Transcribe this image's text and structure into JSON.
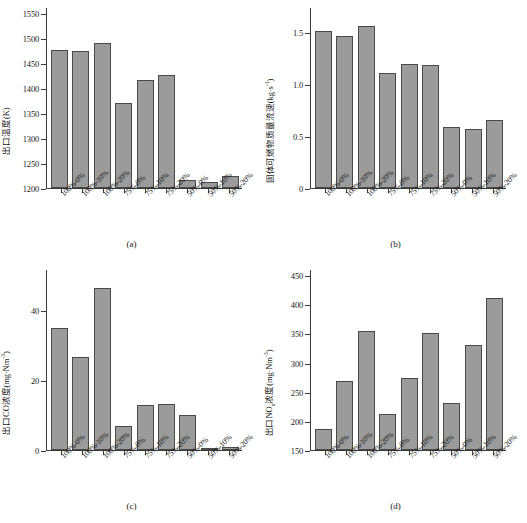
{
  "figure": {
    "categories": [
      "100%-0%",
      "100%-10%",
      "100%-20%",
      "75%-0%",
      "75%-10%",
      "75%-20%",
      "50%-0%",
      "50%-10%",
      "50%-20%"
    ]
  },
  "chart_data": [
    {
      "type": "bar",
      "panel": "(a)",
      "title": "",
      "xlabel": "",
      "ylabel": "出口温度(K)",
      "categories": [
        "100%-0%",
        "100%-10%",
        "100%-20%",
        "75%-0%",
        "75%-10%",
        "75%-20%",
        "50%-0%",
        "50%-10%",
        "50%-20%"
      ],
      "values": [
        1477,
        1474,
        1490,
        1371,
        1417,
        1427,
        1216,
        1212,
        1224
      ],
      "ylim": [
        1200,
        1550
      ],
      "yticks": [
        1200,
        1250,
        1300,
        1350,
        1400,
        1450,
        1500,
        1550
      ],
      "yticklabels": [
        "1200",
        "1250",
        "1300",
        "1350",
        "1400",
        "1450",
        "1500",
        "1550"
      ],
      "grid": false,
      "legend": "none",
      "bar_color": "#9b9b9b",
      "edge_color": "#4a4a4a"
    },
    {
      "type": "bar",
      "panel": "(b)",
      "title": "",
      "xlabel": "",
      "ylabel": "固体可燃物质量流速(kg·s⁻¹)",
      "categories": [
        "100%-0%",
        "100%-10%",
        "100%-20%",
        "75%-0%",
        "75%-10%",
        "75%-20%",
        "50%-0%",
        "50%-10%",
        "50%-20%"
      ],
      "values": [
        1.51,
        1.46,
        1.56,
        1.1,
        1.19,
        1.18,
        0.59,
        0.57,
        0.65
      ],
      "ylim": [
        0,
        1.68
      ],
      "yticks": [
        0,
        0.5,
        1.0,
        1.5
      ],
      "yticklabels": [
        "0",
        "0.5",
        "1.0",
        "1.5"
      ],
      "grid": false,
      "legend": "none",
      "bar_color": "#9b9b9b",
      "edge_color": "#4a4a4a"
    },
    {
      "type": "bar",
      "panel": "(c)",
      "title": "",
      "xlabel": "",
      "ylabel": "出口CO浓度(mg·Nm⁻³)",
      "categories": [
        "100%-0%",
        "100%-10%",
        "100%-20%",
        "75%-0%",
        "75%-10%",
        "75%-20%",
        "50%-0%",
        "50%-10%",
        "50%-20%"
      ],
      "values": [
        35.0,
        26.5,
        46.2,
        7.0,
        13.0,
        13.2,
        10.0,
        0.5,
        1.0
      ],
      "ylim": [
        0,
        50
      ],
      "yticks": [
        0,
        20,
        40
      ],
      "yticklabels": [
        "0",
        "20",
        "40"
      ],
      "grid": false,
      "legend": "none",
      "bar_color": "#9b9b9b",
      "edge_color": "#4a4a4a"
    },
    {
      "type": "bar",
      "panel": "(d)",
      "title": "",
      "xlabel": "",
      "ylabel": "出口NOx浓度(mg·Nm⁻³)",
      "categories": [
        "100%-0%",
        "100%-10%",
        "100%-20%",
        "75%-0%",
        "75%-10%",
        "75%-20%",
        "50%-0%",
        "50%-10%",
        "50%-20%"
      ],
      "values": [
        186,
        269,
        354,
        212,
        274,
        351,
        230,
        330,
        410
      ],
      "ylim": [
        150,
        450
      ],
      "yticks": [
        150,
        200,
        250,
        300,
        350,
        400,
        450
      ],
      "yticklabels": [
        "150",
        "200",
        "250",
        "300",
        "350",
        "400",
        "450"
      ],
      "grid": false,
      "legend": "none",
      "bar_color": "#9b9b9b",
      "edge_color": "#4a4a4a"
    }
  ]
}
